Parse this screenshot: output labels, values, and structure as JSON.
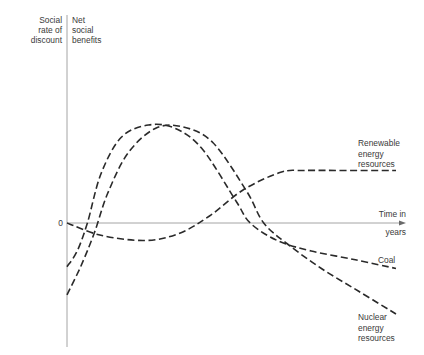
{
  "chart_data": {
    "type": "line",
    "title": "",
    "ylabel_left": [
      "Social",
      "rate of",
      "discount"
    ],
    "ylabel_right": [
      "Net",
      "social",
      "benefits"
    ],
    "xlabel": [
      "Time in",
      "years"
    ],
    "zero_label": "0",
    "grid": false,
    "legend": "inline labels at right end of each curve",
    "xlim": [
      0,
      10
    ],
    "ylim": [
      -6,
      10
    ],
    "series": [
      {
        "name": "Coal",
        "label": [
          "Coal"
        ],
        "x": [
          0,
          0.3,
          0.6,
          1.0,
          1.6,
          2.4,
          3.2,
          4.0,
          5.0,
          5.4,
          6.2,
          7.2,
          8.5,
          9.7
        ],
        "values": [
          -2.5,
          -1.6,
          0.0,
          2.8,
          4.9,
          5.6,
          5.4,
          4.2,
          1.2,
          0.0,
          -1.0,
          -1.6,
          -2.1,
          -2.6
        ]
      },
      {
        "name": "Nuclear energy resources",
        "label": [
          "Nuclear",
          "energy",
          "resources"
        ],
        "x": [
          0,
          0.4,
          0.8,
          1.2,
          1.8,
          2.6,
          3.4,
          4.3,
          5.3,
          5.8,
          6.5,
          7.5,
          8.6,
          9.7
        ],
        "values": [
          -4.1,
          -2.5,
          -0.6,
          1.7,
          4.0,
          5.4,
          5.5,
          4.6,
          1.8,
          0.0,
          -1.2,
          -2.6,
          -3.9,
          -5.2
        ]
      },
      {
        "name": "Renewable energy resources",
        "label": [
          "Renewable",
          "energy",
          "resources"
        ],
        "x": [
          0,
          1.0,
          2.3,
          3.3,
          4.2,
          5.2,
          6.3,
          7.0,
          8.2,
          9.7
        ],
        "values": [
          0.0,
          -0.7,
          -1.0,
          -0.6,
          0.4,
          1.9,
          2.9,
          3.0,
          3.0,
          3.0
        ]
      }
    ]
  }
}
